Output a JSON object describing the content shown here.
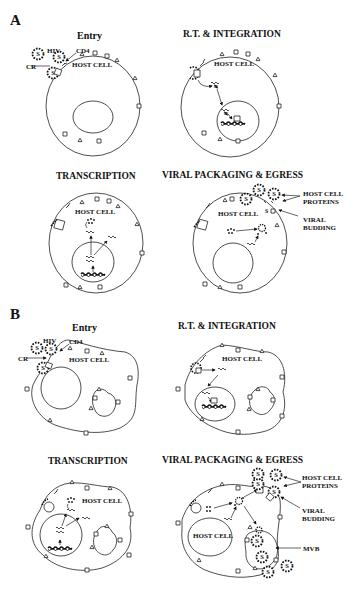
{
  "figure": {
    "panels": [
      {
        "label": "A",
        "cell_shape": "round",
        "steps": [
          {
            "title": "Entry",
            "labels": {
              "virus": "HIV",
              "receptor": "CD4",
              "coreceptor": "CR",
              "cell": "HOST CELL"
            }
          },
          {
            "title": "R.T. & INTEGRATION",
            "labels": {
              "cell": "HOST CELL"
            }
          },
          {
            "title": "TRANSCRIPTION",
            "labels": {
              "cell": "HOST CELL"
            }
          },
          {
            "title": "VIRAL PACKAGING & EGRESS",
            "labels": {
              "cell": "HOST CELL",
              "proteins": "HOST CELL PROTEINS",
              "proteins_line1": "HOST CELL",
              "proteins_line2": "PROTEINS",
              "budding_line1": "VIRAL",
              "budding_line2": "BUDDING"
            }
          }
        ]
      },
      {
        "label": "B",
        "cell_shape": "irregular (macrophage)",
        "steps": [
          {
            "title": "Entry",
            "labels": {
              "virus": "HIV",
              "receptor": "CD4",
              "coreceptor": "CR",
              "cell": "HOST CELL"
            }
          },
          {
            "title": "R.T. & INTEGRATION",
            "labels": {
              "cell": "HOST CELL"
            }
          },
          {
            "title": "TRANSCRIPTION",
            "labels": {
              "cell": "HOST CELL"
            }
          },
          {
            "title": "VIRAL PACKAGING & EGRESS",
            "labels": {
              "cell": "HOST CELL",
              "proteins_line1": "HOST CELL",
              "proteins_line2": "PROTEINS",
              "budding_line1": "VIRAL",
              "budding_line2": "BUDDING",
              "mvb": "MVB"
            }
          }
        ]
      }
    ],
    "colors": {
      "line": "#222222",
      "background": "#ffffff"
    }
  }
}
